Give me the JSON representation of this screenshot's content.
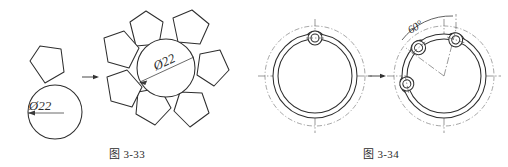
{
  "page": {
    "width": 508,
    "height": 167,
    "background": "#ffffff",
    "line_color": "#2e2e2e",
    "text_color": "#2b2b2b"
  },
  "figures": [
    {
      "id": "figure-33",
      "caption": "图 3-33",
      "description": "pentagon-and-circle circular array pattern",
      "before": {
        "label": "single pentagon above circle",
        "dimension_label": "Ø22",
        "shapes": [
          "pentagon",
          "circle"
        ]
      },
      "transform_arrow": "→",
      "after": {
        "label": "seven pentagons arrayed around central circle",
        "dimension_label": "Ø22",
        "array_count": 7
      }
    },
    {
      "id": "figure-34",
      "caption": "图 3-34",
      "description": "ring with lug circular array at 60 degrees",
      "before": {
        "label": "ring with single lug at top",
        "lug_count": 1
      },
      "transform_arrow": "→",
      "after": {
        "label": "ring with three lugs spaced 60 degrees apart",
        "lug_count": 3,
        "angle_label": "60°"
      }
    }
  ]
}
